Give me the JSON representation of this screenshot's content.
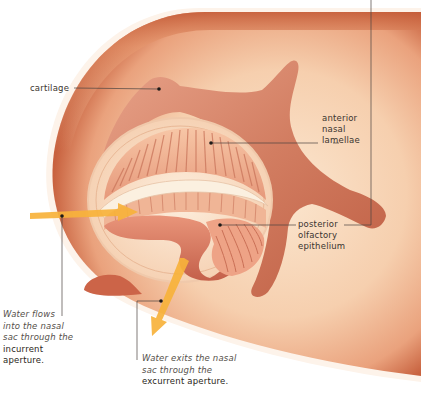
{
  "labels": {
    "cartilage": "cartilage",
    "anterior": [
      "anterior",
      "nasal",
      "lamellae"
    ],
    "posterior": [
      "posterior",
      "olfactory",
      "epithelium"
    ]
  },
  "captions": {
    "incurrent": {
      "italic_lines": [
        "Water flows",
        "into the nasal",
        "sac through the"
      ],
      "bold_lines": [
        "incurrent",
        "aperture."
      ]
    },
    "excurrent": {
      "italic_lines": [
        "Water exits the nasal",
        "sac through the"
      ],
      "bold_lines": [
        "excurrent aperture."
      ]
    }
  },
  "colors": {
    "skin_outer": "#c8623f",
    "skin_inner": "#f6d2b2",
    "cartilage": "#cf7a5e",
    "lamellae": "#f2b896",
    "arrow": "#f7b23b",
    "leader_line": "#4a4440"
  }
}
